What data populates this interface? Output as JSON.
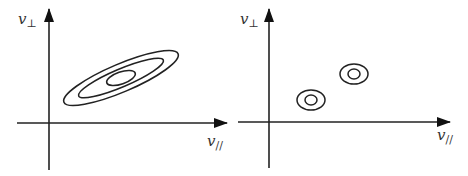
{
  "panels": [
    {
      "name": "left-panel",
      "y_axis_label": "v",
      "y_axis_sub": "⊥",
      "x_axis_label": "v",
      "x_axis_sub": "//",
      "description": "Nested elongated ellipses tilted along diagonal (correlated distribution)",
      "contours": [
        {
          "cx": 121,
          "cy": 78,
          "rx": 62,
          "ry": 14,
          "angle": -23
        },
        {
          "cx": 121,
          "cy": 78,
          "rx": 46,
          "ry": 9,
          "angle": -23
        },
        {
          "cx": 121,
          "cy": 78,
          "rx": 15,
          "ry": 6,
          "angle": -23
        }
      ]
    },
    {
      "name": "right-panel",
      "y_axis_label": "v",
      "y_axis_sub": "⊥",
      "x_axis_label": "v",
      "x_axis_sub": "//",
      "description": "Two small concentric-ring clusters",
      "clusters": [
        {
          "cx": 311,
          "cy": 100,
          "outer_rx": 14,
          "outer_ry": 10,
          "inner_rx": 6,
          "inner_ry": 5
        },
        {
          "cx": 354,
          "cy": 74,
          "outer_rx": 14,
          "outer_ry": 10,
          "inner_rx": 6,
          "inner_ry": 5
        }
      ]
    }
  ],
  "colors": {
    "stroke": "#222222",
    "background": "#ffffff"
  }
}
